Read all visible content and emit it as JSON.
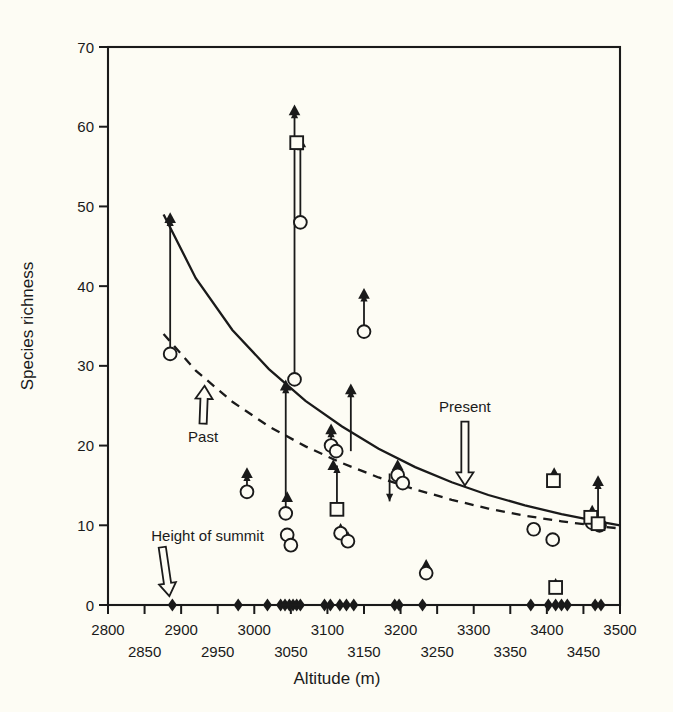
{
  "figure": {
    "background": "#fdfcf4",
    "ink": "#1a1a1a"
  },
  "chart_data": {
    "type": "scatter",
    "title": "",
    "xlabel": "Altitude (m)",
    "ylabel": "Species richness",
    "xlim": [
      2800,
      3500
    ],
    "ylim": [
      0,
      70
    ],
    "grid": false,
    "legend": "none",
    "xticks": [
      2800,
      2850,
      2900,
      2950,
      3000,
      3050,
      3100,
      3150,
      3200,
      3250,
      3300,
      3350,
      3400,
      3450,
      3500
    ],
    "xtick_labels": [
      "2800",
      "2850",
      "2900",
      "2950",
      "3000",
      "3050",
      "3100",
      "3150",
      "3200",
      "3250",
      "3300",
      "3350",
      "3400",
      "3450",
      "3500"
    ],
    "xtick_label_rows": [
      0,
      1,
      0,
      1,
      0,
      1,
      0,
      1,
      0,
      1,
      0,
      1,
      0,
      1,
      0
    ],
    "yticks": [
      0,
      10,
      20,
      30,
      40,
      50,
      60,
      70
    ],
    "ytick_labels": [
      "0",
      "10",
      "20",
      "30",
      "40",
      "50",
      "60",
      "70"
    ],
    "series": [
      {
        "name": "Past (triangle)",
        "marker": "filled-triangle",
        "points": [
          {
            "x": 2885,
            "y": 48.5
          },
          {
            "x": 2990,
            "y": 16.5
          },
          {
            "x": 3043,
            "y": 27.5
          },
          {
            "x": 3045,
            "y": 13.5
          },
          {
            "x": 3048,
            "y": 8.2
          },
          {
            "x": 3055,
            "y": 62.0
          },
          {
            "x": 3063,
            "y": 58.0
          },
          {
            "x": 3105,
            "y": 22.0
          },
          {
            "x": 3108,
            "y": 17.5
          },
          {
            "x": 3118,
            "y": 9.5
          },
          {
            "x": 3128,
            "y": 8.5
          },
          {
            "x": 3132,
            "y": 27.0
          },
          {
            "x": 3150,
            "y": 39.0
          },
          {
            "x": 3196,
            "y": 17.5
          },
          {
            "x": 3235,
            "y": 5.0
          },
          {
            "x": 3410,
            "y": 16.5
          },
          {
            "x": 3412,
            "y": 2.6
          },
          {
            "x": 3462,
            "y": 11.8
          },
          {
            "x": 3470,
            "y": 15.5
          }
        ]
      },
      {
        "name": "Present (circle)",
        "marker": "open-circle",
        "points": [
          {
            "x": 2885,
            "y": 31.5
          },
          {
            "x": 2990,
            "y": 14.2
          },
          {
            "x": 3043,
            "y": 11.5
          },
          {
            "x": 3045,
            "y": 8.8
          },
          {
            "x": 3050,
            "y": 7.5
          },
          {
            "x": 3055,
            "y": 28.3
          },
          {
            "x": 3063,
            "y": 48.0
          },
          {
            "x": 3105,
            "y": 20.0
          },
          {
            "x": 3112,
            "y": 19.3
          },
          {
            "x": 3118,
            "y": 9.0
          },
          {
            "x": 3128,
            "y": 8.0
          },
          {
            "x": 3150,
            "y": 34.3
          },
          {
            "x": 3196,
            "y": 16.3
          },
          {
            "x": 3203,
            "y": 15.3
          },
          {
            "x": 3235,
            "y": 4.0
          },
          {
            "x": 3382,
            "y": 9.5
          },
          {
            "x": 3408,
            "y": 8.2
          },
          {
            "x": 3462,
            "y": 10.3
          },
          {
            "x": 3472,
            "y": 10.0
          }
        ]
      },
      {
        "name": "Open square",
        "marker": "open-square",
        "points": [
          {
            "x": 3058,
            "y": 58.0
          },
          {
            "x": 3113,
            "y": 12.0
          },
          {
            "x": 3409,
            "y": 15.6
          },
          {
            "x": 3412,
            "y": 2.2
          },
          {
            "x": 3460,
            "y": 11.0
          },
          {
            "x": 3470,
            "y": 10.2
          }
        ]
      },
      {
        "name": "Summit altitude (baseline diamond)",
        "marker": "filled-diamond",
        "points": [
          {
            "x": 2888,
            "y": 0
          },
          {
            "x": 2978,
            "y": 0
          },
          {
            "x": 3018,
            "y": 0
          },
          {
            "x": 3036,
            "y": 0
          },
          {
            "x": 3042,
            "y": 0
          },
          {
            "x": 3048,
            "y": 0
          },
          {
            "x": 3053,
            "y": 0
          },
          {
            "x": 3058,
            "y": 0
          },
          {
            "x": 3063,
            "y": 0
          },
          {
            "x": 3096,
            "y": 0
          },
          {
            "x": 3104,
            "y": 0
          },
          {
            "x": 3117,
            "y": 0
          },
          {
            "x": 3126,
            "y": 0
          },
          {
            "x": 3136,
            "y": 0
          },
          {
            "x": 3192,
            "y": 0
          },
          {
            "x": 3198,
            "y": 0
          },
          {
            "x": 3230,
            "y": 0
          },
          {
            "x": 3378,
            "y": 0
          },
          {
            "x": 3402,
            "y": 0
          },
          {
            "x": 3412,
            "y": 0
          },
          {
            "x": 3420,
            "y": 0
          },
          {
            "x": 3428,
            "y": 0
          },
          {
            "x": 3466,
            "y": 0
          },
          {
            "x": 3474,
            "y": 0
          }
        ]
      }
    ],
    "connectors": [
      {
        "x": 2885,
        "y0": 31.5,
        "y1": 48.5,
        "direction": "up"
      },
      {
        "x": 2990,
        "y0": 14.2,
        "y1": 16.5,
        "direction": "up"
      },
      {
        "x": 3043,
        "y0": 11.5,
        "y1": 27.5,
        "direction": "up"
      },
      {
        "x": 3048,
        "y0": 7.5,
        "y1": 8.2,
        "direction": "up"
      },
      {
        "x": 3055,
        "y0": 28.3,
        "y1": 62.0,
        "direction": "up"
      },
      {
        "x": 3063,
        "y0": 48.0,
        "y1": 58.0,
        "direction": "up"
      },
      {
        "x": 3105,
        "y0": 20.0,
        "y1": 22.0,
        "direction": "up"
      },
      {
        "x": 3113,
        "y0": 12.0,
        "y1": 17.5,
        "direction": "up"
      },
      {
        "x": 3128,
        "y0": 8.0,
        "y1": 8.5,
        "direction": "up"
      },
      {
        "x": 3132,
        "y0": 19.3,
        "y1": 27.0,
        "direction": "up"
      },
      {
        "x": 3150,
        "y0": 34.3,
        "y1": 39.0,
        "direction": "up"
      },
      {
        "x": 3185,
        "y0": 16.5,
        "y1": 13.0,
        "direction": "down"
      },
      {
        "x": 3196,
        "y0": 16.3,
        "y1": 17.5,
        "direction": "up"
      },
      {
        "x": 3235,
        "y0": 4.0,
        "y1": 5.0,
        "direction": "up"
      },
      {
        "x": 3470,
        "y0": 10.2,
        "y1": 15.5,
        "direction": "up"
      }
    ],
    "curves": [
      {
        "name": "Present",
        "style": "solid",
        "points": [
          {
            "x": 2876,
            "y": 49.0
          },
          {
            "x": 2920,
            "y": 41.0
          },
          {
            "x": 2970,
            "y": 34.5
          },
          {
            "x": 3020,
            "y": 29.6
          },
          {
            "x": 3070,
            "y": 25.6
          },
          {
            "x": 3120,
            "y": 22.4
          },
          {
            "x": 3170,
            "y": 19.6
          },
          {
            "x": 3220,
            "y": 17.3
          },
          {
            "x": 3270,
            "y": 15.4
          },
          {
            "x": 3320,
            "y": 13.8
          },
          {
            "x": 3370,
            "y": 12.5
          },
          {
            "x": 3420,
            "y": 11.4
          },
          {
            "x": 3470,
            "y": 10.5
          },
          {
            "x": 3500,
            "y": 10.0
          }
        ]
      },
      {
        "name": "Past",
        "style": "dashed",
        "points": [
          {
            "x": 2876,
            "y": 34.0
          },
          {
            "x": 2920,
            "y": 29.4
          },
          {
            "x": 2970,
            "y": 25.5
          },
          {
            "x": 3020,
            "y": 22.4
          },
          {
            "x": 3070,
            "y": 19.9
          },
          {
            "x": 3120,
            "y": 17.8
          },
          {
            "x": 3170,
            "y": 16.0
          },
          {
            "x": 3220,
            "y": 14.5
          },
          {
            "x": 3270,
            "y": 13.2
          },
          {
            "x": 3320,
            "y": 12.1
          },
          {
            "x": 3370,
            "y": 11.2
          },
          {
            "x": 3420,
            "y": 10.5
          },
          {
            "x": 3470,
            "y": 9.9
          },
          {
            "x": 3500,
            "y": 9.6
          }
        ]
      }
    ],
    "annotations": [
      {
        "id": "past",
        "label": "Past",
        "arrow": "hollow-up",
        "label_x": 2930,
        "label_y": 22.0,
        "target_x": 2932,
        "target_y": 27.5
      },
      {
        "id": "present",
        "label": "Present",
        "arrow": "hollow-down",
        "label_x": 3288,
        "label_y": 22.5,
        "target_x": 3288,
        "target_y": 15.0
      },
      {
        "id": "height-of-summit",
        "label": "Height of summit",
        "arrow": "hollow-diagonal",
        "label_x": 2866,
        "label_y": 6.0,
        "target_x": 2888,
        "target_y": 0.6
      }
    ]
  }
}
